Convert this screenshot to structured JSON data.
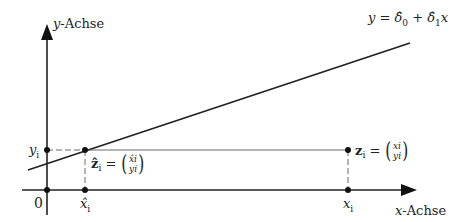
{
  "diagram": {
    "type": "regression-residual-illustration",
    "axes": {
      "y_label_var": "y",
      "y_label_suffix": "-Achse",
      "x_label_var": "x",
      "x_label_suffix": "-Achse",
      "origin_label": "0"
    },
    "line_equation": {
      "lhs": "y",
      "eq": " = ",
      "d0": "δ̂",
      "d0_sub": "0",
      "plus": " + ",
      "d1": "δ̂",
      "d1_sub": "1",
      "x": "x"
    },
    "point_hat": {
      "name": "ẑ",
      "sub": "i",
      "eq": " = ",
      "top": "x̂i",
      "bottom": "yi"
    },
    "point_obs": {
      "name": "z",
      "sub": "i",
      "eq": " = ",
      "top": "xi",
      "bottom": "yi"
    },
    "tick_labels": {
      "yi": "y",
      "yi_sub": "i",
      "xhat_i": "x̂",
      "xhat_i_sub": "i",
      "x_i": "x",
      "x_i_sub": "i"
    },
    "colors": {
      "ink": "#222222",
      "background": "#ffffff"
    }
  }
}
